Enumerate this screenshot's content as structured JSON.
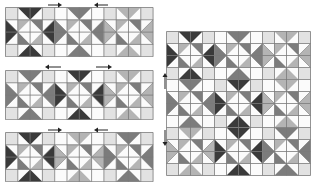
{
  "figure": {
    "caption": "",
    "colors": {
      "grid": "#7a7a7a",
      "background": "#ffffff",
      "dark": "#3a3a3a",
      "mid": "#7c7c7c",
      "light": "#b4b4b4",
      "pale": "#e2e2e2",
      "white": "#fbfbfb",
      "arrow": "#222222"
    },
    "panels": [
      {
        "id": "strip-top",
        "x": 5,
        "y": 7,
        "cols": 12,
        "rows": 4,
        "cell": 12.3,
        "tones": [
          "dark",
          "mid",
          "light"
        ]
      },
      {
        "id": "strip-middle",
        "x": 5,
        "y": 70,
        "cols": 12,
        "rows": 4,
        "cell": 12.3,
        "tones": [
          "mid",
          "dark",
          "light"
        ]
      },
      {
        "id": "strip-bottom",
        "x": 5,
        "y": 132,
        "cols": 12,
        "rows": 4,
        "cell": 12.3,
        "tones": [
          "dark",
          "light",
          "mid"
        ]
      },
      {
        "id": "large-panel",
        "x": 166,
        "y": 31,
        "cols": 12,
        "rows": 12,
        "cell": 12,
        "tones": [
          "dark",
          "mid",
          "light",
          "mid",
          "dark",
          "light",
          "light",
          "dark",
          "mid"
        ]
      }
    ],
    "arrows": [
      {
        "id": "arrow-top-right",
        "x": 48,
        "y": 2,
        "len": 14,
        "dir": "right"
      },
      {
        "id": "arrow-top-left",
        "x": 94,
        "y": 2,
        "len": 14,
        "dir": "left"
      },
      {
        "id": "arrow-middle-left",
        "x": 45,
        "y": 64,
        "len": 16,
        "dir": "left"
      },
      {
        "id": "arrow-middle-right",
        "x": 96,
        "y": 64,
        "len": 16,
        "dir": "right"
      },
      {
        "id": "arrow-bottom-right",
        "x": 48,
        "y": 127,
        "len": 14,
        "dir": "right"
      },
      {
        "id": "arrow-bottom-left",
        "x": 94,
        "y": 127,
        "len": 14,
        "dir": "left"
      },
      {
        "id": "arrow-side-up",
        "x": 162,
        "y": 73,
        "len": 16,
        "dir": "up"
      },
      {
        "id": "arrow-side-down",
        "x": 162,
        "y": 130,
        "len": 16,
        "dir": "down"
      }
    ]
  }
}
